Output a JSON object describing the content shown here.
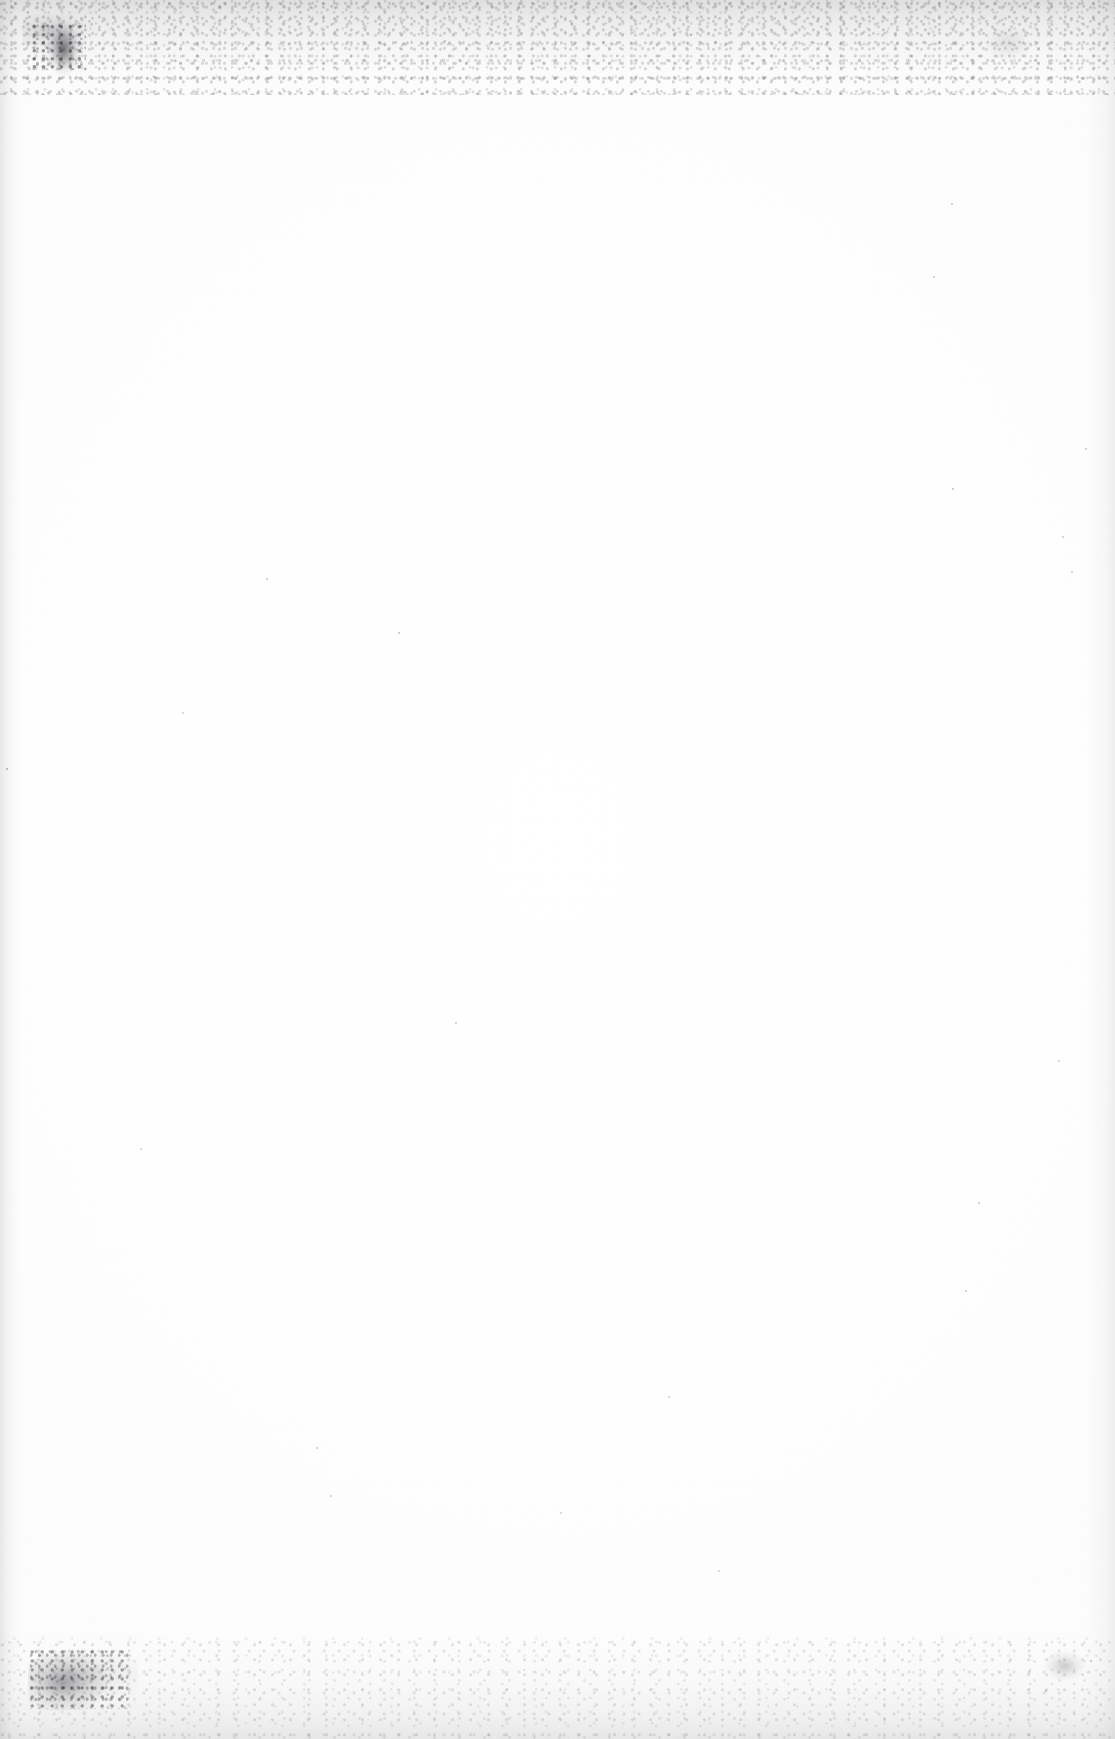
{
  "page": {
    "kind": "blank-scanned-page",
    "visible_text": "",
    "width_px": 1115,
    "height_px": 1739,
    "background_color": "#ffffff",
    "paper_tone_color": "#fdfdfd",
    "edge_shadow_color": "#8a8a8f",
    "speck_color": "#46464e",
    "smudge_color": "#28282d"
  },
  "artifacts": {
    "top_noise_band": {
      "label": "",
      "position": "top",
      "height_px": 95,
      "color": "#8f8f95"
    },
    "bottom_noise_band": {
      "label": "",
      "position": "bottom",
      "height_px": 105,
      "color": "#9a9aa0"
    },
    "left_edge_shadow": {
      "label": "",
      "position": "left",
      "width_px": 22,
      "color": "#78787d"
    },
    "right_edge_shadow": {
      "label": "",
      "position": "right",
      "width_px": 30,
      "color": "#7d7d82"
    },
    "corner_smudges": [
      {
        "label": "",
        "corner": "top-left",
        "color": "#28282d"
      },
      {
        "label": "",
        "corner": "bottom-left",
        "color": "#37373c"
      },
      {
        "label": "",
        "corner": "bottom-right",
        "color": "#46464b"
      },
      {
        "label": "",
        "corner": "top-right",
        "color": "#78787d"
      }
    ],
    "dust_specks": [
      {
        "x": 6,
        "y": 768,
        "size": 2.2,
        "opacity": 0.42
      },
      {
        "x": 266,
        "y": 578,
        "size": 1.8,
        "opacity": 0.3
      },
      {
        "x": 398,
        "y": 632,
        "size": 1.7,
        "opacity": 0.28
      },
      {
        "x": 182,
        "y": 712,
        "size": 1.6,
        "opacity": 0.24
      },
      {
        "x": 316,
        "y": 1447,
        "size": 1.8,
        "opacity": 0.3
      },
      {
        "x": 455,
        "y": 1022,
        "size": 1.6,
        "opacity": 0.25
      },
      {
        "x": 668,
        "y": 1396,
        "size": 1.6,
        "opacity": 0.24
      },
      {
        "x": 796,
        "y": 92,
        "size": 2.0,
        "opacity": 0.34
      },
      {
        "x": 933,
        "y": 276,
        "size": 1.8,
        "opacity": 0.28
      },
      {
        "x": 951,
        "y": 203,
        "size": 1.7,
        "opacity": 0.26
      },
      {
        "x": 952,
        "y": 488,
        "size": 1.9,
        "opacity": 0.32
      },
      {
        "x": 978,
        "y": 1202,
        "size": 2.0,
        "opacity": 0.34
      },
      {
        "x": 965,
        "y": 1290,
        "size": 1.8,
        "opacity": 0.28
      },
      {
        "x": 1062,
        "y": 536,
        "size": 1.7,
        "opacity": 0.26
      },
      {
        "x": 1085,
        "y": 448,
        "size": 1.8,
        "opacity": 0.28
      },
      {
        "x": 1071,
        "y": 571,
        "size": 1.6,
        "opacity": 0.24
      },
      {
        "x": 1058,
        "y": 1060,
        "size": 1.6,
        "opacity": 0.22
      },
      {
        "x": 1090,
        "y": 1660,
        "size": 2.1,
        "opacity": 0.36
      },
      {
        "x": 1045,
        "y": 1690,
        "size": 1.7,
        "opacity": 0.26
      },
      {
        "x": 230,
        "y": 28,
        "size": 1.9,
        "opacity": 0.33
      },
      {
        "x": 444,
        "y": 40,
        "size": 1.7,
        "opacity": 0.27
      },
      {
        "x": 690,
        "y": 34,
        "size": 1.8,
        "opacity": 0.3
      },
      {
        "x": 560,
        "y": 1512,
        "size": 1.6,
        "opacity": 0.22
      },
      {
        "x": 718,
        "y": 1570,
        "size": 1.6,
        "opacity": 0.22
      },
      {
        "x": 140,
        "y": 1148,
        "size": 1.6,
        "opacity": 0.22
      },
      {
        "x": 330,
        "y": 1495,
        "size": 1.7,
        "opacity": 0.25
      }
    ]
  }
}
